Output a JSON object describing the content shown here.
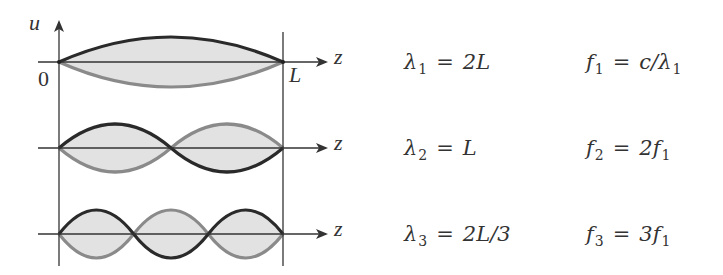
{
  "diagram": {
    "type": "standing-wave-modes",
    "axis_labels": {
      "vertical": "u",
      "horizontal": "z",
      "origin": "0",
      "end": "L"
    },
    "colors": {
      "curve_positive": "#2a2a2a",
      "curve_negative": "#8a8a8a",
      "fill": "#e2e2e2",
      "axis": "#333333"
    },
    "modes": [
      {
        "n": 1,
        "half_wavelengths": 1,
        "axis_label": "z",
        "wavelength": {
          "symbol": "λ",
          "sub": "1",
          "eq": "=",
          "rhs": "2L"
        },
        "frequency": {
          "symbol": "f",
          "sub": "1",
          "eq": "=",
          "rhs_a": "c/λ",
          "rhs_sub": "1"
        }
      },
      {
        "n": 2,
        "half_wavelengths": 2,
        "axis_label": "z",
        "wavelength": {
          "symbol": "λ",
          "sub": "2",
          "eq": "=",
          "rhs": "L"
        },
        "frequency": {
          "symbol": "f",
          "sub": "2",
          "eq": "=",
          "rhs_a": "2f",
          "rhs_sub": "1"
        }
      },
      {
        "n": 3,
        "half_wavelengths": 3,
        "axis_label": "z",
        "wavelength": {
          "symbol": "λ",
          "sub": "3",
          "eq": "=",
          "rhs": "2L/3"
        },
        "frequency": {
          "symbol": "f",
          "sub": "3",
          "eq": "=",
          "rhs_a": "3f",
          "rhs_sub": "1"
        }
      }
    ]
  }
}
